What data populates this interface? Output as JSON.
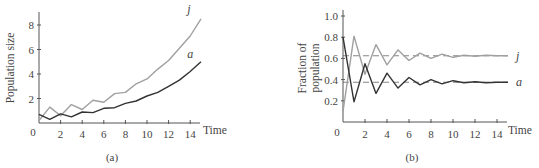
{
  "chart_data": [
    {
      "type": "line",
      "panel": "a",
      "caption": "(a)",
      "title": "",
      "xlabel": "Time",
      "ylabel": "Population size",
      "xlim": [
        0,
        15
      ],
      "ylim": [
        0,
        9
      ],
      "x_ticks": [
        2,
        4,
        6,
        8,
        10,
        12,
        14
      ],
      "x_origin_label": "0",
      "y_ticks": [
        2,
        4,
        6,
        8
      ],
      "grid": false,
      "legend": "inline labels at line ends",
      "x": [
        0,
        1,
        2,
        3,
        4,
        5,
        6,
        7,
        8,
        9,
        10,
        11,
        12,
        13,
        14,
        15
      ],
      "series": [
        {
          "name": "j",
          "color": "#a0a0a0",
          "values": [
            0.2,
            1.3,
            0.6,
            1.5,
            1.1,
            1.85,
            1.7,
            2.4,
            2.5,
            3.2,
            3.6,
            4.4,
            5.1,
            6.1,
            7.1,
            8.5
          ]
        },
        {
          "name": "a",
          "color": "#333333",
          "values": [
            0.7,
            0.3,
            0.75,
            0.5,
            0.9,
            0.85,
            1.2,
            1.25,
            1.6,
            1.8,
            2.2,
            2.5,
            3.0,
            3.5,
            4.2,
            5.0
          ]
        }
      ]
    },
    {
      "type": "line",
      "panel": "b",
      "caption": "(b)",
      "title": "",
      "xlabel": "Time",
      "ylabel": "Fraction of population",
      "ylabel_lines": [
        "Fraction of",
        "population"
      ],
      "xlim": [
        0,
        15
      ],
      "ylim": [
        0,
        1.0
      ],
      "x_ticks": [
        2,
        4,
        6,
        8,
        10,
        12,
        14
      ],
      "x_origin_label": "0",
      "y_ticks": [
        "0.2",
        "0.4",
        "0.6",
        "0.8",
        "1.0"
      ],
      "grid": false,
      "legend": "inline labels at line ends",
      "reference_lines": [
        {
          "name": "j-equilibrium",
          "y": 0.625,
          "style": "dashed"
        },
        {
          "name": "a-equilibrium",
          "y": 0.375,
          "style": "dashed"
        }
      ],
      "x": [
        0,
        1,
        2,
        3,
        4,
        5,
        6,
        7,
        8,
        9,
        10,
        11,
        12,
        13,
        14,
        15
      ],
      "series": [
        {
          "name": "j",
          "color": "#a0a0a0",
          "values": [
            0.1,
            0.81,
            0.45,
            0.73,
            0.54,
            0.68,
            0.58,
            0.65,
            0.6,
            0.64,
            0.61,
            0.63,
            0.62,
            0.63,
            0.625,
            0.625
          ]
        },
        {
          "name": "a",
          "color": "#333333",
          "values": [
            0.8,
            0.19,
            0.55,
            0.27,
            0.46,
            0.32,
            0.42,
            0.35,
            0.4,
            0.36,
            0.39,
            0.37,
            0.38,
            0.37,
            0.375,
            0.375
          ]
        }
      ]
    }
  ]
}
